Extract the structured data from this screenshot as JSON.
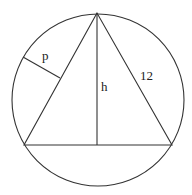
{
  "diagram": {
    "labels": {
      "perpendicular": "p",
      "altitude": "h",
      "side": "12"
    },
    "stroke_color": "#333333",
    "background": "#ffffff"
  }
}
